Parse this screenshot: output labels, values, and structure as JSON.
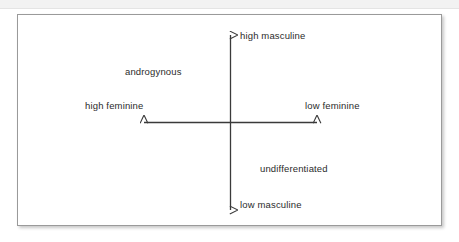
{
  "figure": {
    "type": "quadrant-diagram",
    "title": "",
    "background_color": "#ffffff",
    "border_color": "#9a9a9a",
    "axis_color": "#3a3a3a",
    "text_color": "#2b2b2b",
    "axes": {
      "vertical": {
        "name": "masculinity-axis",
        "top_label": "high masculine",
        "bottom_label": "low masculine",
        "double_headed": true
      },
      "horizontal": {
        "name": "femininity-axis",
        "left_label": "high feminine",
        "right_label": "low feminine",
        "double_headed": true
      }
    },
    "labels": {
      "high_masculine": "high masculine",
      "low_masculine": "low masculine",
      "high_feminine": "high feminine",
      "low_feminine": "low feminine",
      "androgynous": "androgynous",
      "undifferentiated": "undifferentiated"
    },
    "quadrant_annotations": [
      {
        "quadrant": "upper-left",
        "label": "androgynous"
      },
      {
        "quadrant": "lower-right",
        "label": "undifferentiated"
      }
    ]
  }
}
